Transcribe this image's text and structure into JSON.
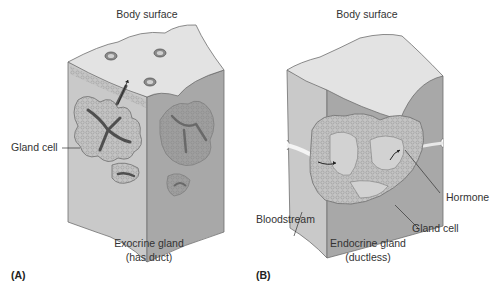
{
  "panels": [
    {
      "id": "A",
      "panel_label": "(A)",
      "top_label": "Body surface",
      "caption_line1": "Exocrine gland",
      "caption_line2": "(has duct)",
      "callouts": [
        "Gland cell"
      ]
    },
    {
      "id": "B",
      "panel_label": "(B)",
      "top_label": "Body surface",
      "caption_line1": "Endocrine gland",
      "caption_line2": "(ductless)",
      "callouts": [
        "Bloodstream",
        "Gland cell",
        "Hormone"
      ]
    }
  ],
  "colors": {
    "top_face": "#e4e4e4",
    "left_face": "#c8c8c8",
    "right_face": "#a9a9a9",
    "tissue": "#b9b9b9",
    "duct": "#5a5a5a",
    "outline": "#6e6e6e",
    "text": "#333333"
  }
}
